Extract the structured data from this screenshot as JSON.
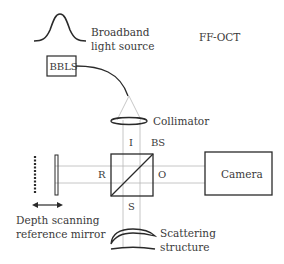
{
  "diagram": {
    "title": "FF-OCT",
    "source_label_line1": "Broadband",
    "source_label_line2": "light source",
    "bbls_box": "BBLS",
    "collimator": "Collimator",
    "beamsplitter": "BS",
    "arm_input": "I",
    "arm_reference": "R",
    "arm_output": "O",
    "arm_sample": "S",
    "camera": "Camera",
    "reference_label_line1": "Depth scanning",
    "reference_label_line2": "reference mirror",
    "sample_label_line1": "Scattering",
    "sample_label_line2": "structure",
    "colors": {
      "line": "#2a2a2a",
      "ray": "#b8b8b8",
      "text": "#3a3a3a"
    }
  }
}
